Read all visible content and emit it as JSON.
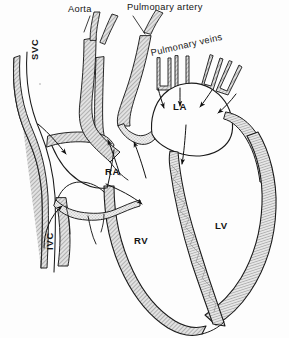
{
  "figure": {
    "background_color": "#fdfdfd",
    "ink_color": "#1a1a1a",
    "wall_fill_color": "#d8d8d8",
    "lumen_fill_color": "#fdfdfd",
    "width": 289,
    "height": 338
  },
  "callout_labels": [
    {
      "id": "aorta",
      "text": "Aorta"
    },
    {
      "id": "pulmonary-artery",
      "text": "Pulmonary artery"
    },
    {
      "id": "pulmonary-veins",
      "text": "Pulmonary veins"
    },
    {
      "id": "svc",
      "text": "SVC"
    },
    {
      "id": "ivc",
      "text": "IVC"
    }
  ],
  "chamber_labels": [
    {
      "id": "ra",
      "text": "RA"
    },
    {
      "id": "la",
      "text": "LA"
    },
    {
      "id": "rv",
      "text": "RV"
    },
    {
      "id": "lv",
      "text": "LV"
    }
  ],
  "flow_arrows": {
    "count": 10,
    "description": "black arrows indicating direction of blood flow"
  }
}
